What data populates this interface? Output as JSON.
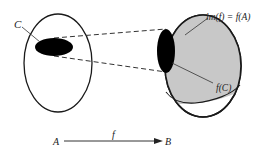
{
  "diagram": {
    "labels": {
      "subset": "C",
      "image": "im(f) = f(A)",
      "image_of_subset": "f(C)",
      "domain": "A",
      "map": "f",
      "codomain": "B"
    },
    "colors": {
      "stroke": "#1a1a1a",
      "image_fill": "#c8c8c8",
      "subset_fill": "#000000",
      "background": "#ffffff"
    }
  }
}
